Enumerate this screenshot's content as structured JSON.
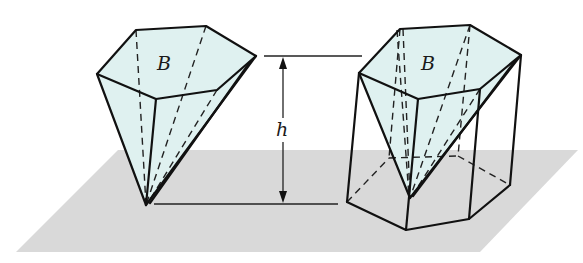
{
  "figure": {
    "base_label_left": "B",
    "base_label_right": "B",
    "height_label": "h"
  },
  "colors": {
    "plane": "#d9d9d9",
    "solid_fill": "#dff1f0",
    "edge": "#111111"
  }
}
